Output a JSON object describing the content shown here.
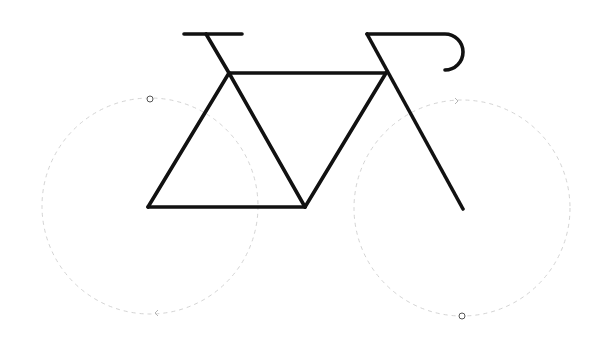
{
  "diagram": {
    "colors": {
      "frame": "#111111",
      "wheel_outline": "#d4d4d4",
      "handle": "#555555",
      "background": "#ffffff"
    },
    "wheels": [
      {
        "name": "rear-wheel",
        "cx": 150,
        "cy": 206,
        "r": 108,
        "style": "dashed"
      },
      {
        "name": "front-wheel",
        "cx": 462,
        "cy": 208,
        "r": 108,
        "style": "dashed"
      }
    ],
    "handles": [
      {
        "name": "rear-wheel-handle",
        "cx": 150,
        "cy": 99
      },
      {
        "name": "front-wheel-handle",
        "cx": 462,
        "cy": 316
      }
    ],
    "direction_arrows": [
      {
        "name": "front-wheel-arrow",
        "x": 458,
        "y": 101,
        "direction": "right"
      },
      {
        "name": "rear-wheel-arrow",
        "x": 155,
        "y": 313,
        "direction": "left"
      }
    ],
    "frame_segments": [
      {
        "name": "saddle",
        "x1": 184,
        "y1": 34,
        "x2": 242,
        "y2": 34
      },
      {
        "name": "seat-post",
        "x1": 206,
        "y1": 34,
        "x2": 229,
        "y2": 73
      },
      {
        "name": "top-tube",
        "x1": 229,
        "y1": 73,
        "x2": 386,
        "y2": 73
      },
      {
        "name": "seat-stay",
        "x1": 229,
        "y1": 73,
        "x2": 148,
        "y2": 207
      },
      {
        "name": "seat-tube",
        "x1": 229,
        "y1": 73,
        "x2": 305,
        "y2": 207
      },
      {
        "name": "chain-stay",
        "x1": 148,
        "y1": 207,
        "x2": 305,
        "y2": 207
      },
      {
        "name": "down-tube",
        "x1": 305,
        "y1": 207,
        "x2": 386,
        "y2": 73
      },
      {
        "name": "fork",
        "x1": 367,
        "y1": 34,
        "x2": 463,
        "y2": 209
      }
    ],
    "handlebar_path": "M367 34 L445 34 A18 18 0 0 1 445 70"
  }
}
